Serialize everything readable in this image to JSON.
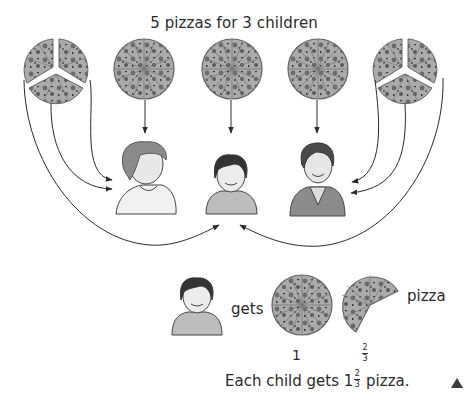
{
  "title": "5 pizzas for 3 children",
  "pizzas": [
    {
      "id": 1,
      "state": "cut into 3 pieces",
      "cx": 56,
      "cy": 70
    },
    {
      "id": 2,
      "state": "whole",
      "cx": 144,
      "cy": 69
    },
    {
      "id": 3,
      "state": "whole",
      "cx": 232,
      "cy": 69
    },
    {
      "id": 4,
      "state": "whole",
      "cx": 318,
      "cy": 69
    },
    {
      "id": 5,
      "state": "cut into 3 pieces",
      "cx": 405,
      "cy": 70
    }
  ],
  "children": [
    {
      "id": "left",
      "description": "child with curly hair, light shirt"
    },
    {
      "id": "middle",
      "description": "child with dark hair, grey sweater"
    },
    {
      "id": "right",
      "description": "child with dark hair, robe"
    }
  ],
  "result": {
    "gets_label": "gets",
    "whole_label": "1",
    "fraction": {
      "numerator": "2",
      "denominator": "3"
    },
    "unit_label": "pizza"
  },
  "caption": {
    "prefix": "Each child gets 1",
    "fraction": {
      "numerator": "2",
      "denominator": "3"
    },
    "suffix": " pizza."
  },
  "colors": {
    "pizza_fill": "#a9a9a9",
    "pizza_topping": "#5e5e5e",
    "line": "#333333",
    "skin": "#e6e6e6",
    "hair_dark": "#3a3a3a",
    "hair_light": "#8a8a8a"
  }
}
